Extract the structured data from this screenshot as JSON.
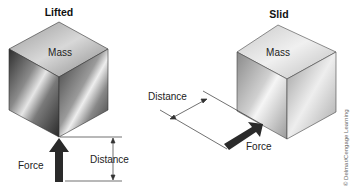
{
  "panels": {
    "lifted": {
      "title": "Lifted",
      "mass_label": "Mass",
      "force_label": "Force",
      "distance_label": "Distance"
    },
    "slid": {
      "title": "Slid",
      "mass_label": "Mass",
      "force_label": "Force",
      "distance_label": "Distance"
    }
  },
  "credit": "© Delmar/Cengage Learning",
  "colors": {
    "arrow": "#2a2a2a",
    "lines": "#333333",
    "cube_dark": "#3a3a3a",
    "cube_light": "#e8e8e8"
  }
}
